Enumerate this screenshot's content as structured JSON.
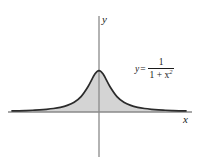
{
  "figure": {
    "name": "area-under-curve-graph",
    "background_color": "#ffffff"
  },
  "axes": {
    "x_label": "x",
    "y_label": "y",
    "axis_color": "#8a8a8a",
    "x_axis_y_px": 112,
    "y_axis_x_px": 99,
    "x_axis_start_px": 8,
    "x_axis_end_px": 192,
    "y_axis_top_px": 16,
    "y_axis_bottom_px": 157
  },
  "annotation": {
    "equation_lhs": "y",
    "equation_equals": "=",
    "equation_numerator": "1",
    "equation_denominator_base": "1 + x",
    "equation_denominator_exponent": "2"
  },
  "style": {
    "curve_color": "#2b2b2b",
    "fill_color": "#d4d4d4",
    "fill_stroke_color": "#9a9a9a",
    "text_color": "#1a1a1a"
  },
  "chart_data": {
    "type": "area",
    "title": "",
    "xlabel": "x",
    "ylabel": "y",
    "function": "y = 1/(1 + x^2)",
    "legend": [
      "y = 1/(1 + x^2)"
    ],
    "grid": false,
    "legend_position": "upper right inside plot",
    "xlim": [
      -6.3,
      6.3
    ],
    "ylim": [
      0,
      1.38
    ],
    "shaded_region": "area between curve and x-axis over entire visible domain",
    "x": [
      -6.3,
      -5.8,
      -5.3,
      -4.8,
      -4.3,
      -3.8,
      -3.3,
      -2.8,
      -2.3,
      -1.8,
      -1.3,
      -0.8,
      -0.3,
      0,
      0.3,
      0.8,
      1.3,
      1.8,
      2.3,
      2.8,
      3.3,
      3.8,
      4.3,
      4.8,
      5.3,
      5.8,
      6.3
    ],
    "y": [
      0.025,
      0.029,
      0.034,
      0.042,
      0.051,
      0.065,
      0.084,
      0.113,
      0.159,
      0.236,
      0.372,
      0.61,
      0.917,
      1.0,
      0.917,
      0.61,
      0.372,
      0.236,
      0.159,
      0.113,
      0.084,
      0.065,
      0.051,
      0.042,
      0.034,
      0.029,
      0.025
    ]
  }
}
